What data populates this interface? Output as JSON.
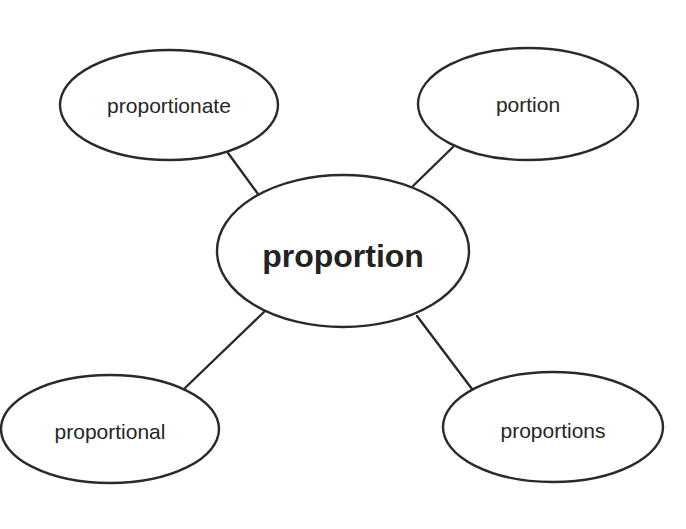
{
  "diagram": {
    "type": "word-web",
    "center": {
      "label": "proportion",
      "cx": 343,
      "cy": 251,
      "rx": 126,
      "ry": 76
    },
    "nodes": [
      {
        "id": "proportionate",
        "label": "proportionate",
        "cx": 169,
        "cy": 105,
        "rx": 109,
        "ry": 55,
        "line": {
          "x1": 228,
          "y1": 153,
          "x2": 258,
          "y2": 194
        }
      },
      {
        "id": "portion",
        "label": "portion",
        "cx": 528,
        "cy": 104,
        "rx": 110,
        "ry": 56,
        "line": {
          "x1": 453,
          "y1": 147,
          "x2": 413,
          "y2": 186
        }
      },
      {
        "id": "proportional",
        "label": "proportional",
        "cx": 110,
        "cy": 429,
        "rx": 109,
        "ry": 54,
        "line": {
          "x1": 185,
          "y1": 388,
          "x2": 265,
          "y2": 311
        }
      },
      {
        "id": "proportions",
        "label": "proportions",
        "cx": 553,
        "cy": 427,
        "rx": 110,
        "ry": 55,
        "line": {
          "x1": 472,
          "y1": 389,
          "x2": 417,
          "y2": 316
        }
      }
    ],
    "colors": {
      "stroke": "#2a2a2a",
      "text": "#262626",
      "background": "#ffffff"
    }
  }
}
